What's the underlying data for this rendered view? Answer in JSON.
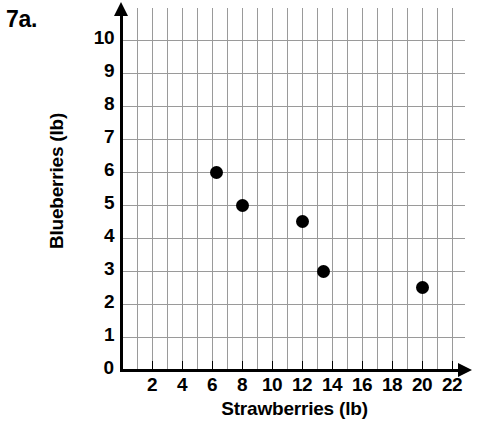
{
  "problem_label": "7a.",
  "chart_data": {
    "type": "scatter",
    "title": "",
    "xlabel": "Strawberries (lb)",
    "ylabel": "Blueberries (lb)",
    "xlim": [
      0,
      23
    ],
    "ylim": [
      0,
      10.7
    ],
    "grid": true,
    "legend": "none",
    "x_ticks": [
      2,
      4,
      6,
      8,
      10,
      12,
      14,
      16,
      18,
      20,
      22
    ],
    "y_ticks": [
      1,
      2,
      3,
      4,
      5,
      6,
      7,
      8,
      9,
      10
    ],
    "origin_label": "0",
    "x_tick_labels": [
      "2",
      "4",
      "6",
      "8",
      "10",
      "12",
      "14",
      "16",
      "18",
      "20",
      "22"
    ],
    "y_tick_labels": [
      "1",
      "2",
      "3",
      "4",
      "5",
      "6",
      "7",
      "8",
      "9",
      "10"
    ],
    "points": [
      {
        "x": 6.3,
        "y": 6
      },
      {
        "x": 8,
        "y": 5
      },
      {
        "x": 12,
        "y": 4.5
      },
      {
        "x": 13.4,
        "y": 3
      },
      {
        "x": 20,
        "y": 2.5
      }
    ]
  }
}
